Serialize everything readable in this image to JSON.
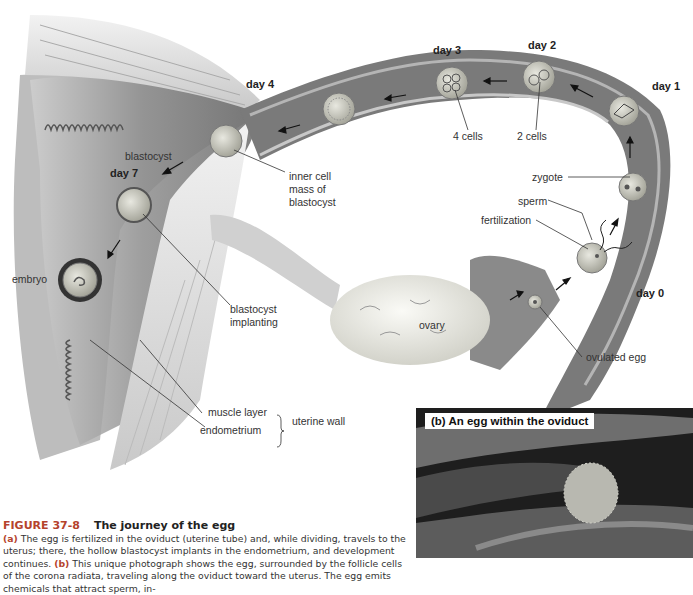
{
  "figure": {
    "part_a_label": "(a)",
    "days": {
      "day0": "day 0",
      "day1": "day 1",
      "day2": "day 2",
      "day3": "day 3",
      "day4": "day 4",
      "day7": "day 7"
    },
    "labels": {
      "four_cells": "4 cells",
      "two_cells": "2 cells",
      "zygote": "zygote",
      "sperm": "sperm",
      "fertilization": "fertilization",
      "ovulated_egg": "ovulated egg",
      "ovary": "ovary",
      "blastocyst": "blastocyst",
      "inner_cell_mass_1": "inner cell",
      "inner_cell_mass_2": "mass of",
      "inner_cell_mass_3": "blastocyst",
      "blastocyst_implanting_1": "blastocyst",
      "blastocyst_implanting_2": "implanting",
      "embryo": "embryo",
      "muscle_layer": "muscle layer",
      "endometrium": "endometrium",
      "uterine_wall": "uterine wall"
    }
  },
  "photo": {
    "label": "(b) An egg within the oviduct"
  },
  "caption": {
    "figure_number": "FIGURE 37-8",
    "title": "The journey of the egg",
    "part_a": "(a)",
    "text_a": " The egg is fertilized in the oviduct (uterine tube) and, while dividing, travels to the uterus; there, the hollow blastocyst implants in the endometrium, and development continues. ",
    "part_b": "(b)",
    "text_b": " This unique photograph shows the egg, surrounded by the follicle cells of the corona radiata, traveling along the oviduct toward the uterus. The egg emits chemicals that attract sperm, in-"
  }
}
